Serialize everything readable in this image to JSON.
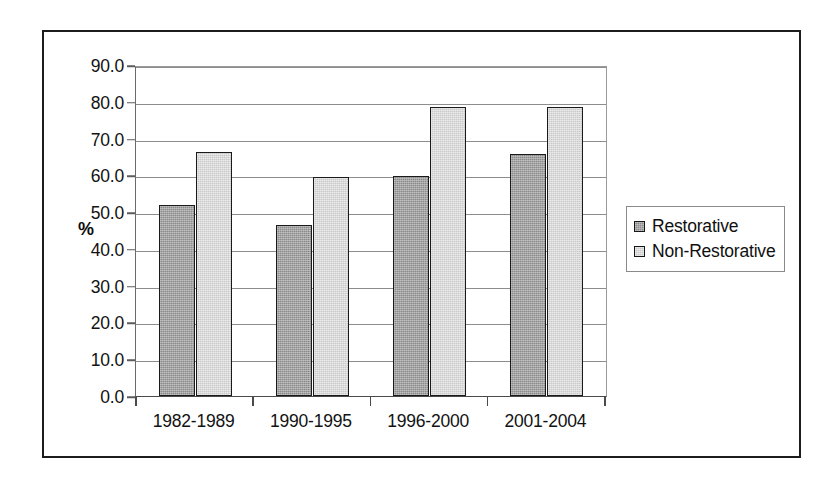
{
  "chart_data": {
    "type": "bar",
    "title": "",
    "xlabel": "",
    "ylabel": "%",
    "categories": [
      "1982-1989",
      "1990-1995",
      "1996-2000",
      "2001-2004"
    ],
    "series": [
      {
        "name": "Restorative",
        "values": [
          52.3,
          46.8,
          60.1,
          66.2
        ],
        "color": "#8a8a8a"
      },
      {
        "name": "Non-Restorative",
        "values": [
          66.7,
          60.0,
          79.0,
          79.0
        ],
        "color": "#c9c9c9"
      }
    ],
    "ylim": [
      0.0,
      90.0
    ],
    "ytick_step": 10.0,
    "ytick_labels": [
      "0.0",
      "10.0",
      "20.0",
      "30.0",
      "40.0",
      "50.0",
      "60.0",
      "70.0",
      "80.0",
      "90.0"
    ],
    "grid": true,
    "grid_axis": "y",
    "legend_position": "right",
    "legend_entries": [
      "Restorative",
      "Non-Restorative"
    ],
    "annotations": []
  },
  "frame": {
    "border_color": "#1c1c1c"
  }
}
